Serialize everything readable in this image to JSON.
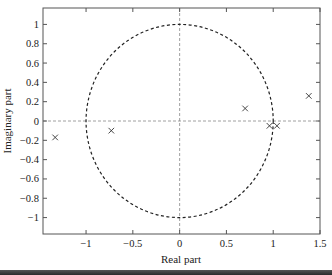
{
  "chart_data": {
    "type": "scatter",
    "title": "",
    "xlabel": "Real part",
    "ylabel": "Imaginary part",
    "xlim": [
      -1.46,
      1.5
    ],
    "ylim": [
      -1.17,
      1.17
    ],
    "grid": false,
    "legend": null,
    "x_ticks": [
      -1,
      -0.5,
      0,
      0.5,
      1,
      1.5
    ],
    "x_tick_labels": [
      "−1",
      "−0.5",
      "0",
      "0.5",
      "1",
      "1.5"
    ],
    "y_ticks": [
      1,
      0.8,
      0.6,
      0.4,
      0.2,
      0,
      -0.2,
      -0.4,
      -0.6,
      -0.8,
      -1
    ],
    "y_tick_labels": [
      "1",
      "0.8",
      "0.6",
      "0.4",
      "0.2",
      "0",
      "−0.2",
      "−0.4",
      "−0.6",
      "−0.8",
      "−1"
    ],
    "annotations": [
      {
        "type": "unit-circle",
        "style": "dashed",
        "radius": 1
      },
      {
        "type": "axis-line",
        "orientation": "horizontal",
        "value": 0,
        "style": "dashed"
      },
      {
        "type": "axis-line",
        "orientation": "vertical",
        "value": 0,
        "style": "dashed"
      }
    ],
    "series": [
      {
        "name": "poles",
        "marker": "x",
        "points": [
          {
            "x": -1.33,
            "y": -0.17
          },
          {
            "x": -0.73,
            "y": -0.1
          },
          {
            "x": 0.7,
            "y": 0.13
          },
          {
            "x": 1.38,
            "y": 0.26
          },
          {
            "x": 0.96,
            "y": -0.05
          },
          {
            "x": 1.04,
            "y": -0.05
          }
        ]
      }
    ]
  },
  "colors": {
    "axes": "#555555",
    "circle": "#222222",
    "marker": "#333333",
    "zero_lines": "#888888"
  }
}
